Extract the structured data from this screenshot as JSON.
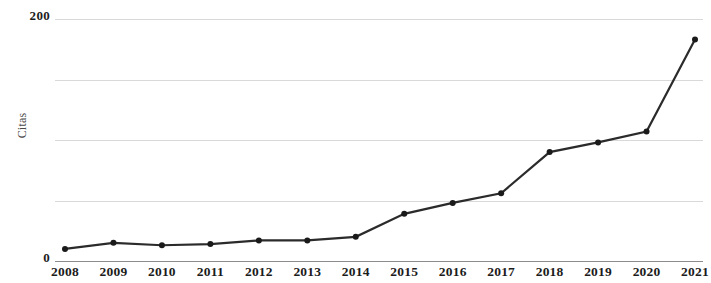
{
  "chart_data": {
    "type": "line",
    "title": "",
    "subtitle": "",
    "xlabel": "",
    "ylabel": "Citas",
    "categories": [
      "2008",
      "2009",
      "2010",
      "2011",
      "2012",
      "2013",
      "2014",
      "2015",
      "2016",
      "2017",
      "2018",
      "2019",
      "2020",
      "2021"
    ],
    "values": [
      10,
      15,
      13,
      14,
      17,
      17,
      20,
      39,
      48,
      56,
      90,
      98,
      107,
      183
    ],
    "series": [
      {
        "name": "Citas",
        "values": [
          10,
          15,
          13,
          14,
          17,
          17,
          20,
          39,
          48,
          56,
          90,
          98,
          107,
          183
        ]
      }
    ],
    "ylim": [
      0,
      200
    ],
    "y_ticks": [
      0,
      200
    ],
    "y_tick_labels": [
      "0",
      "200"
    ],
    "gridline_values": [
      0,
      50,
      100,
      150,
      200
    ],
    "grid": true,
    "legend": "none",
    "line_color": "#2b2b2b",
    "marker_color": "#1a1a1a",
    "grid_color": "#d9d9d9",
    "axis_color": "#8c8c8c"
  },
  "axes": {
    "y_title": "Citas",
    "y_max_label": "200",
    "y_min_label": "0"
  }
}
